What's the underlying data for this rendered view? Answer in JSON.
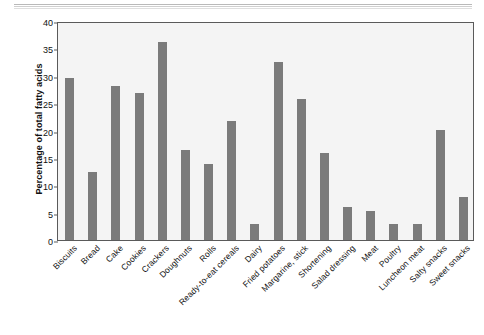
{
  "figure": {
    "ylabel": "Percentage of total fatty acids"
  },
  "chart_data": {
    "type": "bar",
    "title": "",
    "xlabel": "",
    "ylabel": "Percentage of total fatty acids",
    "ylim": [
      0,
      40
    ],
    "yticks": [
      0,
      5,
      10,
      15,
      20,
      25,
      30,
      35,
      40
    ],
    "grid": false,
    "legend": null,
    "bar_color": "#7b7b7b",
    "plot_background": "#f4f4f4",
    "categories": [
      "Biscuits",
      "Bread",
      "Cake",
      "Cookies",
      "Crackers",
      "Doughnuts",
      "Rolls",
      "Ready-to-eat cereals",
      "Dairy",
      "Fried potatoes",
      "Margarine, stick",
      "Shortening",
      "Salad dressing",
      "Meat",
      "Poultry",
      "Luncheon meat",
      "Salty snacks",
      "Sweet snacks"
    ],
    "values": [
      29.6,
      12.4,
      28.2,
      26.9,
      36.2,
      16.4,
      13.9,
      21.8,
      3.0,
      32.5,
      25.8,
      15.9,
      6.1,
      5.3,
      2.9,
      3.0,
      20.1,
      7.9
    ]
  }
}
